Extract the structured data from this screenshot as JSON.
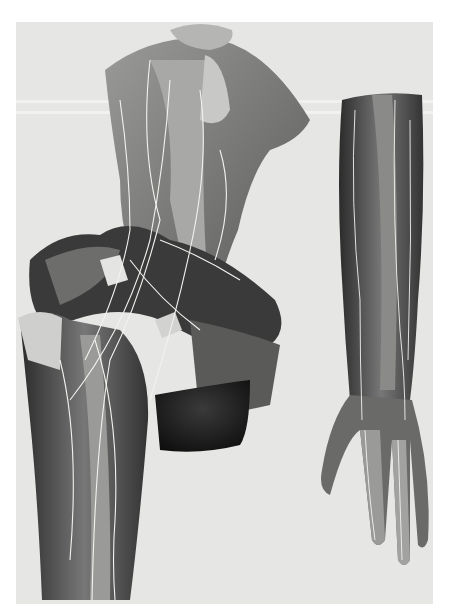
{
  "image": {
    "type": "anatomical-illustration",
    "subject": "Dissection of shoulder, upper arm, forearm and hand showing nerves",
    "style": "grayscale engraving/lithograph",
    "colors": {
      "background": "#e6e6e4",
      "surround": "#ffffff",
      "muscle_dark": "#2a2a2a",
      "muscle_mid": "#6e6e6e",
      "muscle_light": "#b8b8b6",
      "nerve": "#f4f4f0"
    },
    "figures": [
      {
        "name": "shoulder-and-upper-arm",
        "region": "left"
      },
      {
        "name": "forearm-and-hand",
        "region": "right"
      }
    ]
  }
}
